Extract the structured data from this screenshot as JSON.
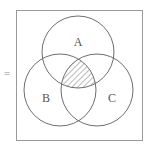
{
  "diagram": {
    "type": "venn",
    "prefix_symbol": "=",
    "universe_box": {
      "x": 16,
      "y": 10,
      "width": 127,
      "height": 131
    },
    "sets": [
      {
        "label": "A",
        "cx": 78,
        "cy": 52,
        "r": 36,
        "label_x": 78,
        "label_y": 46
      },
      {
        "label": "B",
        "cx": 60,
        "cy": 90,
        "r": 36,
        "label_x": 46,
        "label_y": 102
      },
      {
        "label": "C",
        "cx": 97,
        "cy": 90,
        "r": 36,
        "label_x": 112,
        "label_y": 102
      }
    ],
    "shaded_region": "A ∩ B ∩ C",
    "shading_style": "diagonal-hatch",
    "colors": {
      "stroke": "#6e6e6e",
      "box_stroke": "#9a9a9a",
      "hatch": "#777777",
      "background": "#ffffff"
    }
  }
}
